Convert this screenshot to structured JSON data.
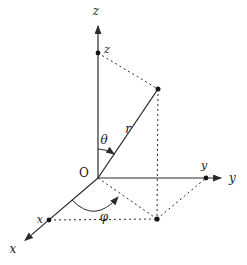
{
  "figure": {
    "type": "spherical-coordinate-system-diagram",
    "background": "#ffffff",
    "ink_color": "#2b2b2b",
    "dot_color": "#151515",
    "axes": {
      "z": {
        "label": "z",
        "intercept_label": "z"
      },
      "y": {
        "label": "y",
        "intercept_label": "y"
      },
      "x": {
        "label": "x",
        "intercept_label": "x"
      }
    },
    "origin_label": "O",
    "radius_label": "r",
    "polar_angle_label": "θ",
    "azimuth_angle_label": "φ",
    "markers": [
      "z-axis-intercept-dot",
      "y-axis-intercept-dot",
      "x-axis-intercept-dot",
      "radius-endpoint-dot",
      "xy-plane-projection-dot"
    ]
  }
}
